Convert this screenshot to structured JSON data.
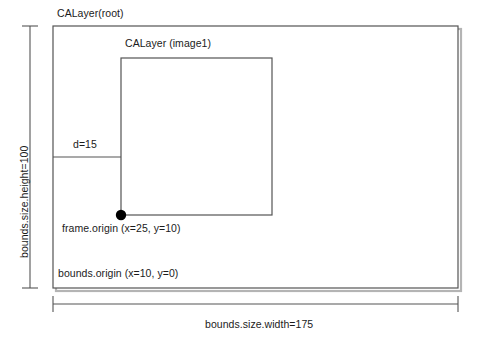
{
  "diagram": {
    "title_root_layer": "CALayer(root)",
    "title_image_layer": "CALayer (image1)",
    "distance_label": "d=15",
    "frame_origin_label": "frame.origin (x=25, y=10)",
    "bounds_origin_label": "bounds.origin (x=10, y=0)",
    "width_dimension_label": "bounds.size.width=175",
    "height_dimension_label": "bounds.size.height=100",
    "colors": {
      "stroke": "#4a4a4a",
      "text": "#1b1b1b",
      "background": "#ffffff",
      "marker": "#000000",
      "shadow": "#9a9a9a"
    },
    "geometry": {
      "root_rect": {
        "x": 53,
        "y": 26,
        "width": 405,
        "height": 262
      },
      "image_rect": {
        "x": 121,
        "y": 58,
        "width": 151,
        "height": 157
      },
      "origin_point": {
        "x": 121,
        "y": 215
      },
      "distance_line_y": 157,
      "width_dimension_line_y": 304,
      "height_dimension_line_x": 30
    },
    "values": {
      "bounds_size_width": 175,
      "bounds_size_height": 100,
      "distance_d": 15,
      "frame_origin_x": 25,
      "frame_origin_y": 10,
      "bounds_origin_x": 10,
      "bounds_origin_y": 0
    }
  }
}
